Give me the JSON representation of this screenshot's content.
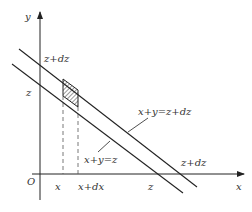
{
  "diagram": {
    "title": "",
    "axes": {
      "x_label": "x",
      "y_label": "y",
      "origin_label": "O"
    },
    "x_ticks": {
      "x": "x",
      "x_plus_dx": "x+dx",
      "z": "z",
      "z_plus_dz": "z+dz"
    },
    "y_ticks": {
      "z": "z",
      "z_plus_dz": "z+dz"
    },
    "lines": {
      "lower": "x+y=z",
      "upper": "x+y=z+dz"
    },
    "shaded_region": "hatched strip between x and x+dx bounded by the two lines",
    "colors": {
      "stroke": "#222222",
      "text": "#333333",
      "dashed": "#555555",
      "background": "#ffffff"
    }
  }
}
